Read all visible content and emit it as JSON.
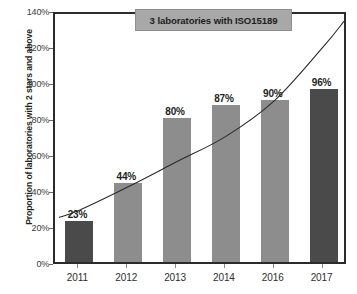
{
  "chart_data": {
    "type": "bar",
    "title": "",
    "subtitle": "",
    "xlabel": "",
    "ylabel": "Proportion of laboratories with 2 stars and above",
    "categories": [
      "2011",
      "2012",
      "2013",
      "2014",
      "2016",
      "2017"
    ],
    "values": [
      23,
      44,
      80,
      87,
      90,
      96
    ],
    "data_labels": [
      "23%",
      "44%",
      "80%",
      "87%",
      "90%",
      "96%"
    ],
    "bar_colors": [
      "#4a4a4a",
      "#8d8d8d",
      "#8d8d8d",
      "#8d8d8d",
      "#8d8d8d",
      "#4a4a4a"
    ],
    "ylim": [
      0,
      140
    ],
    "ytick_values": [
      0,
      20,
      40,
      60,
      80,
      100,
      120,
      140
    ],
    "ytick_labels": [
      "0%",
      "20%",
      "40%",
      "60%",
      "80%",
      "100%",
      "120%",
      "140%"
    ],
    "grid": false,
    "legend": "none",
    "series": [
      {
        "name": "Proportion of laboratories with 2 stars and above",
        "type": "bar",
        "values": [
          23,
          44,
          80,
          87,
          90,
          96
        ]
      },
      {
        "name": "trend",
        "type": "line",
        "note": "smooth exponential trend curve drawn over the bars",
        "values": [
          31,
          44,
          58,
          72,
          92,
          122
        ]
      }
    ],
    "annotations": [
      {
        "name": "iso-callout",
        "text": "3 laboratories with ISO15189",
        "background": "#a8a8a8",
        "border": "#8e8e8e",
        "text_color": "#1d1d1d"
      }
    ]
  },
  "axis": {
    "y_title": "Proportion of laboratories with 2 stars and above"
  },
  "annotation": {
    "label": "3 laboratories with ISO15189"
  },
  "colors": {
    "bar_dark": "#4a4a4a",
    "bar_mid": "#8d8d8d",
    "frame": "#2b2b2b",
    "callout_fill": "#a8a8a8",
    "curve": "#2b2b2b"
  }
}
